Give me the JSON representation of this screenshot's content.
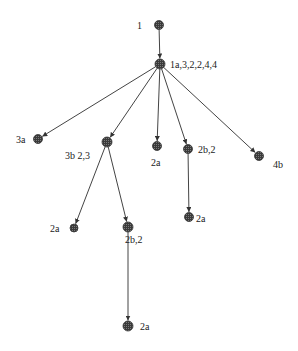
{
  "diagram": {
    "type": "tree",
    "node_color": "#4a4a4a",
    "node_fill_pattern": "crosshatch",
    "nodes": [
      {
        "id": "n1",
        "label": "1",
        "label_side": "left"
      },
      {
        "id": "n2",
        "label": "1a,3,2,2,4,4",
        "label_side": "right"
      },
      {
        "id": "n3",
        "label": "3a",
        "label_side": "left"
      },
      {
        "id": "n4",
        "label": "3b  2,3",
        "label_side": "below-left"
      },
      {
        "id": "n5",
        "label": "2a",
        "label_side": "below"
      },
      {
        "id": "n6",
        "label": "2b,2",
        "label_side": "right"
      },
      {
        "id": "n7",
        "label": "4b",
        "label_side": "below-right"
      },
      {
        "id": "n8",
        "label": "2a",
        "label_side": "left"
      },
      {
        "id": "n9",
        "label": "2b,2",
        "label_side": "below-right"
      },
      {
        "id": "n10",
        "label": "2a",
        "label_side": "right"
      },
      {
        "id": "n11",
        "label": "2a",
        "label_side": "right"
      }
    ],
    "edges": [
      {
        "from": "n1",
        "to": "n2"
      },
      {
        "from": "n2",
        "to": "n3"
      },
      {
        "from": "n2",
        "to": "n4"
      },
      {
        "from": "n2",
        "to": "n5"
      },
      {
        "from": "n2",
        "to": "n6"
      },
      {
        "from": "n2",
        "to": "n7"
      },
      {
        "from": "n4",
        "to": "n8"
      },
      {
        "from": "n4",
        "to": "n9"
      },
      {
        "from": "n6",
        "to": "n10"
      },
      {
        "from": "n9",
        "to": "n11"
      }
    ]
  }
}
